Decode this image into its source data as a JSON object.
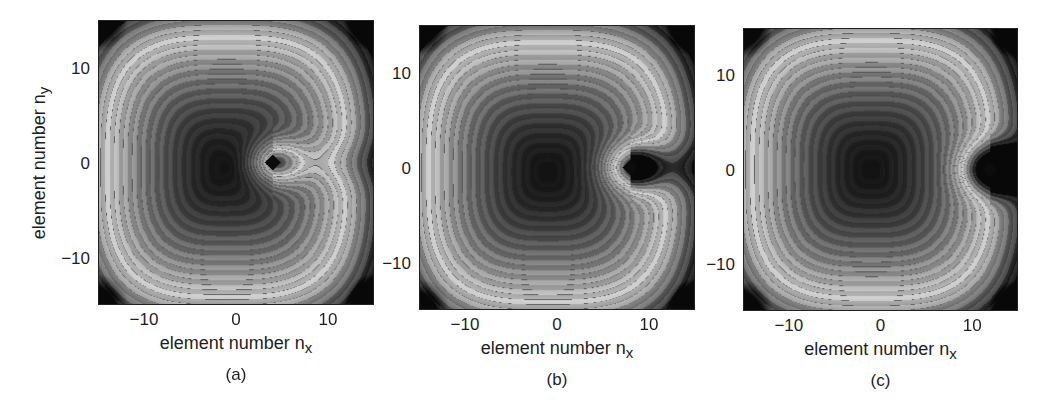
{
  "chart_data": [
    {
      "type": "heatmap",
      "subtype": "filled-contour",
      "panel_label": "(a)",
      "xlabel": "element number n",
      "xlabel_sub": "x",
      "ylabel": "element number n",
      "ylabel_sub": "y",
      "xlim": [
        -15,
        15
      ],
      "ylim": [
        -15,
        15
      ],
      "xticks": [
        -10,
        0,
        10
      ],
      "yticks": [
        10,
        0,
        -10
      ],
      "xtick_labels": [
        "−10",
        "0",
        "10"
      ],
      "ytick_labels": [
        "10",
        "0",
        "−10"
      ],
      "source_marker": {
        "shape": "diamond",
        "x": 4,
        "y": 0
      },
      "minimum_center": {
        "x": -1,
        "y": -0.5
      },
      "colormap": "gray",
      "grid": false
    },
    {
      "type": "heatmap",
      "subtype": "filled-contour",
      "panel_label": "(b)",
      "xlabel": "element number n",
      "xlabel_sub": "x",
      "xlim": [
        -15,
        15
      ],
      "ylim": [
        -15,
        15
      ],
      "xticks": [
        -10,
        0,
        10
      ],
      "yticks": [
        10,
        0,
        -10
      ],
      "xtick_labels": [
        "−10",
        "0",
        "10"
      ],
      "ytick_labels": [
        "10",
        "0",
        "−10"
      ],
      "source_marker": {
        "shape": "diamond",
        "x": 8,
        "y": 0
      },
      "minimum_center": {
        "x": -1,
        "y": -0.5
      },
      "colormap": "gray",
      "grid": false
    },
    {
      "type": "heatmap",
      "subtype": "filled-contour",
      "panel_label": "(c)",
      "xlabel": "element number n",
      "xlabel_sub": "x",
      "xlim": [
        -15,
        15
      ],
      "ylim": [
        -15,
        15
      ],
      "xticks": [
        -10,
        0,
        10
      ],
      "yticks": [
        10,
        0,
        -10
      ],
      "xtick_labels": [
        "−10",
        "0",
        "10"
      ],
      "ytick_labels": [
        "10",
        "0",
        "−10"
      ],
      "source_marker": {
        "shape": "diamond",
        "x": 12,
        "y": 0
      },
      "minimum_center": {
        "x": -1,
        "y": 0
      },
      "colormap": "gray",
      "grid": false
    }
  ],
  "layout": {
    "panels": [
      {
        "left": 98,
        "top": 20,
        "width": 276,
        "height": 285,
        "show_ylabel": true
      },
      {
        "left": 419,
        "top": 25,
        "width": 276,
        "height": 285,
        "show_ylabel": false
      },
      {
        "left": 743,
        "top": 28,
        "width": 275,
        "height": 283,
        "show_ylabel": false
      }
    ],
    "colors": {
      "dark": "#111111",
      "light": "#e2e2e2",
      "contour_line": "#1c1c1c",
      "axis": "#222222"
    }
  }
}
